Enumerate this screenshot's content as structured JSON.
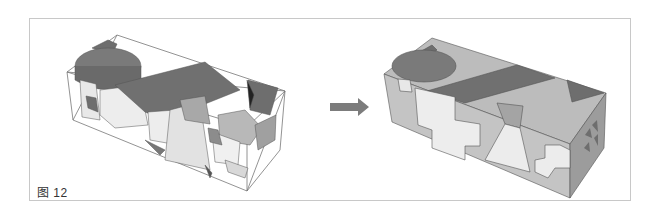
{
  "figure": {
    "caption": "图 12",
    "left_panel": {
      "description": "wireframe box with scattered colored solids (before)"
    },
    "arrow": {
      "direction": "right",
      "color": "#7a7a7a"
    },
    "right_panel": {
      "description": "assembled solid box with projected shapes (after)"
    },
    "colors": {
      "dark": "#6e6e6e",
      "mid": "#9a9a9a",
      "light": "#c4c4c4",
      "pale": "#e6e6e6",
      "outline": "#555555"
    }
  }
}
